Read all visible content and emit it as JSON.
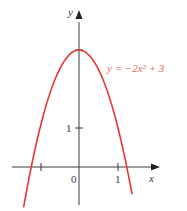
{
  "chart_data": {
    "type": "line",
    "title": "",
    "function": "y = -2x^2 + 3",
    "series": [
      {
        "name": "y = −2x² + 3",
        "color": "#e53935",
        "x": [
          -1.4,
          -1.2247,
          -1.0,
          -0.5,
          0.0,
          0.5,
          1.0,
          1.2247,
          1.4
        ],
        "y": [
          -0.92,
          0.0,
          1.0,
          2.5,
          3.0,
          2.5,
          1.0,
          0.0,
          -0.92
        ]
      }
    ],
    "xlabel": "x",
    "ylabel": "y",
    "x_ticks": [
      -1,
      0,
      1
    ],
    "x_tick_labels": [
      "",
      "0",
      "1"
    ],
    "y_ticks": [
      1,
      3
    ],
    "y_tick_labels": [
      "1",
      ""
    ],
    "xlim": [
      -2.0,
      2.0
    ],
    "ylim": [
      -0.9,
      3.8
    ],
    "grid": false,
    "legend": "none",
    "annotations": [
      {
        "text": "y = −2x² + 3",
        "x": 0.75,
        "y": 2.5,
        "color": "#e8645a"
      }
    ]
  },
  "labels": {
    "x_axis": "x",
    "y_axis": "y",
    "origin": "0",
    "x_one": "1",
    "y_one": "1",
    "equation": "y = −2x² + 3"
  },
  "colors": {
    "curve": "#e53935",
    "axis": "#3a3a3a",
    "equation": "#e8645a"
  }
}
